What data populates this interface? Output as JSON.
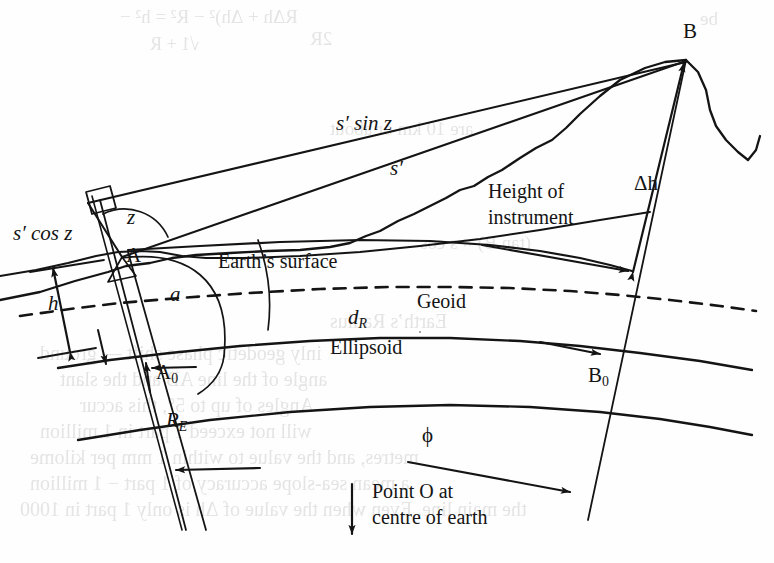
{
  "figure": {
    "domain": "Diagram",
    "page_background": "#fefefe",
    "ink_color": "#141414",
    "width": 774,
    "height": 563
  },
  "labels": {
    "point_b": "B",
    "point_a": "A",
    "point_a0": "A",
    "point_a0_sub": "0",
    "point_b0": "B",
    "point_b0_sub": "0",
    "s_sin_z": "s′ sin z",
    "s_prime": "s′",
    "s_cos_z": "s′ cos z",
    "zenith_angle": "z",
    "arc_angle_a": "a",
    "delta_h": "Δh",
    "height_h": "h",
    "height_of_instrument_line1": "Height of",
    "height_of_instrument_line2": "instrument",
    "earths_surface": "Earth’s surface",
    "geoid": "Geoid",
    "ellipsoid": "Ellipsoid",
    "d_r": "d",
    "d_r_sub": "R",
    "r_e": "R",
    "r_e_sub": "E",
    "phi": "ϕ",
    "point_o_line1": "Point O at",
    "point_o_line2": "centre of earth"
  },
  "bleed_through": {
    "note": "faint mirrored show-through text from the reverse side of the printed page",
    "lines": [
      {
        "text": "RΔh + Δh)² − R² = h² −",
        "x": 120,
        "y": 6,
        "size": 19
      },
      {
        "text": "2R",
        "x": 310,
        "y": 28,
        "size": 19
      },
      {
        "text": "√1 + R",
        "x": 150,
        "y": 34,
        "size": 18
      },
      {
        "text": "be",
        "x": 700,
        "y": 8,
        "size": 19
      },
      {
        "text": "are 10 km or about",
        "x": 330,
        "y": 118,
        "size": 19
      },
      {
        "text": "(tan B) × s cos",
        "x": 420,
        "y": 232,
        "size": 19
      },
      {
        "text": "Earth’s Radius",
        "x": 330,
        "y": 310,
        "size": 20
      },
      {
        "text": "inly geodetic phase shift — ground",
        "x": 40,
        "y": 342,
        "size": 20
      },
      {
        "text": "angle of the line AB and the slant",
        "x": 60,
        "y": 368,
        "size": 20
      },
      {
        "text": "Angles of up to 5°, this accur",
        "x": 80,
        "y": 394,
        "size": 20
      },
      {
        "text": "will not exceed 1 part in 1 million",
        "x": 40,
        "y": 420,
        "size": 20
      },
      {
        "text": "metres, and the value to within 1 mm per kilome",
        "x": 30,
        "y": 446,
        "size": 20
      },
      {
        "text": "a mean sea-slope accuracy of 1 part − 1 million",
        "x": 30,
        "y": 472,
        "size": 20
      },
      {
        "text": "the main line. Even when the value of Δh is only 1 part in 1000",
        "x": 20,
        "y": 498,
        "size": 20
      }
    ]
  },
  "geometry": {
    "point_a": {
      "x": 122,
      "y": 257
    },
    "point_b": {
      "x": 686,
      "y": 60
    },
    "point_a0": {
      "x": 148,
      "y": 371
    },
    "point_b0": {
      "x": 611,
      "y": 375
    },
    "earth_centre_direction": "down"
  }
}
